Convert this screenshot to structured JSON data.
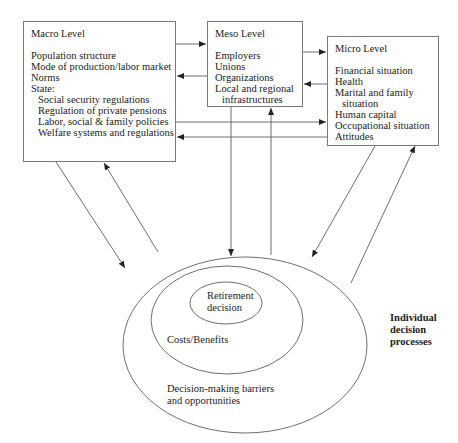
{
  "macro": {
    "title": "Macro Level",
    "items": [
      {
        "text": "Population structure",
        "indent": false
      },
      {
        "text": "Mode of production/labor market",
        "indent": false
      },
      {
        "text": "Norms",
        "indent": false
      },
      {
        "text": "State:",
        "indent": false
      },
      {
        "text": "Social security regulations",
        "indent": true
      },
      {
        "text": "Regulation of private pensions",
        "indent": true
      },
      {
        "text": "Labor, social & family policies",
        "indent": true
      },
      {
        "text": "Welfare systems and regulations",
        "indent": true
      }
    ]
  },
  "meso": {
    "title": "Meso Level",
    "items": [
      {
        "text": "Employers",
        "indent": false
      },
      {
        "text": "Unions",
        "indent": false
      },
      {
        "text": "Organizations",
        "indent": false
      },
      {
        "text": "Local and regional",
        "indent": false
      },
      {
        "text": "infrastructures",
        "indent": true
      }
    ]
  },
  "micro": {
    "title": "Micro Level",
    "items": [
      {
        "text": "Financial situation",
        "indent": false
      },
      {
        "text": "Health",
        "indent": false
      },
      {
        "text": "Marital and family",
        "indent": false
      },
      {
        "text": "situation",
        "indent": true
      },
      {
        "text": "Human capital",
        "indent": false
      },
      {
        "text": "Occupational situation",
        "indent": false
      },
      {
        "text": "Attitudes",
        "indent": false
      }
    ]
  },
  "ellipses": {
    "inner": {
      "line1": "Retirement",
      "line2": "decision"
    },
    "middle": "Costs/Benefits",
    "outer": {
      "line1": "Decision-making barriers",
      "line2": "and opportunities"
    }
  },
  "side_label": {
    "line1": "Individual",
    "line2": "decision",
    "line3": "processes"
  },
  "colors": {
    "line": "#6e6e6e",
    "text": "#222222",
    "background": "#ffffff"
  }
}
